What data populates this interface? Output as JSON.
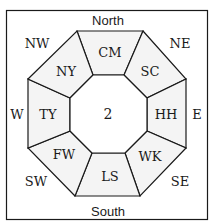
{
  "diagram": {
    "directions": {
      "north": "North",
      "south": "South",
      "east": "E",
      "west": "W",
      "northwest": "NW",
      "northeast": "NE",
      "southwest": "SW",
      "southeast": "SE"
    },
    "center": "2",
    "sectors": {
      "n": "CM",
      "ne": "SC",
      "e": "HH",
      "se": "WK",
      "s": "LS",
      "sw": "FW",
      "w": "TY",
      "nw": "NY"
    },
    "colors": {
      "line": "#1a1a1a",
      "fill": "#f4f4f4",
      "background": "#ffffff"
    }
  }
}
